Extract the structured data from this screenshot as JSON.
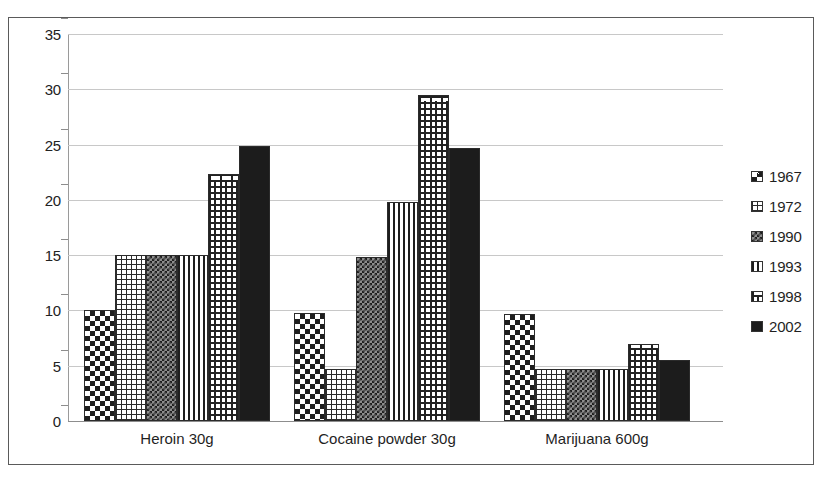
{
  "chart_data": {
    "type": "bar",
    "title": "",
    "xlabel": "",
    "ylabel": "",
    "ylim": [
      0,
      35
    ],
    "ytick_step": 5,
    "yticks": [
      35,
      30,
      25,
      20,
      15,
      10,
      5,
      0
    ],
    "grid": true,
    "legend_position": "right",
    "categories": [
      "Heroin 30g",
      "Cocaine powder 30g",
      "Marijuana 600g"
    ],
    "series": [
      {
        "name": "1967",
        "pattern": "checkerboard",
        "values": [
          10.0,
          9.8,
          9.7
        ]
      },
      {
        "name": "1972",
        "pattern": "fine-grid",
        "values": [
          15.0,
          4.7,
          4.7
        ]
      },
      {
        "name": "1990",
        "pattern": "dense-dots",
        "values": [
          15.0,
          14.8,
          4.7
        ]
      },
      {
        "name": "1993",
        "pattern": "vertical-lines",
        "values": [
          15.0,
          19.8,
          4.7
        ]
      },
      {
        "name": "1998",
        "pattern": "brick",
        "values": [
          22.3,
          29.5,
          7.0
        ]
      },
      {
        "name": "2002",
        "pattern": "solid-black",
        "values": [
          24.9,
          24.7,
          5.5
        ]
      }
    ]
  },
  "legend": {
    "entries": [
      {
        "label": "1967"
      },
      {
        "label": "1972"
      },
      {
        "label": "1990"
      },
      {
        "label": "1993"
      },
      {
        "label": "1998"
      },
      {
        "label": "2002"
      }
    ]
  },
  "colors": {
    "frame_border": "#5a5a5a",
    "gridline": "#c8c8c8",
    "axis": "#8d8d8d",
    "bar_outline": "#2b2b2b",
    "solid_series": "#1c1c1c",
    "text": "#1f1f1f",
    "background": "#ffffff"
  }
}
